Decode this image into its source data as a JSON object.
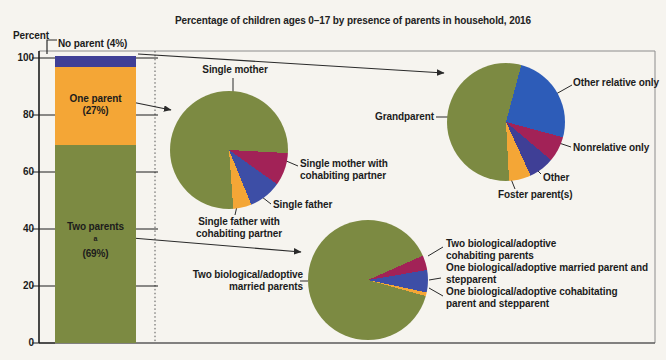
{
  "title": "Percentage of children ages 0–17 by presence of parents in household, 2016",
  "y_axis": {
    "label": "Percent"
  },
  "palette": {
    "green": "#7c8a42",
    "orange": "#f4a636",
    "indigo": "#3f3f96",
    "bright_blue": "#2d5cb8",
    "mid_blue": "#3d4ea6",
    "maroon": "#a22257",
    "text": "#1c1c1c"
  },
  "chart_data": [
    {
      "type": "bar",
      "stacked": true,
      "ylabel": "Percent",
      "ylim": [
        0,
        100
      ],
      "yticks": [
        0,
        20,
        40,
        60,
        80,
        100
      ],
      "segments": [
        {
          "label": "Two parents",
          "footnote_marker": "a",
          "pct_label": "(69%)",
          "value": 69,
          "color": "#7c8a42"
        },
        {
          "label": "One parent",
          "pct_label": "(27%)",
          "value": 27,
          "color": "#f4a636"
        },
        {
          "label": "No parent (4%)",
          "value": 4,
          "color": "#3f3f96"
        }
      ]
    },
    {
      "type": "pie",
      "title": "One parent breakdown",
      "start_angle_deg": 93,
      "slices": [
        {
          "label": "Single mother with cohabiting partner",
          "value": 9,
          "color": "#a22257"
        },
        {
          "label": "Single father",
          "value": 9,
          "color": "#3d4ea6"
        },
        {
          "label": "Single father with cohabiting partner",
          "value": 5,
          "color": "#f4a636"
        },
        {
          "label": "Single mother",
          "value": 77,
          "color": "#7c8a42"
        }
      ]
    },
    {
      "type": "pie",
      "title": "No parent breakdown",
      "start_angle_deg": 15,
      "slices": [
        {
          "label": "Other relative only",
          "value": 25,
          "color": "#2d5cb8"
        },
        {
          "label": "Nonrelative only",
          "value": 7,
          "color": "#a22257"
        },
        {
          "label": "Other",
          "value": 7,
          "color": "#3f3f96"
        },
        {
          "label": "Foster parent(s)",
          "value": 6,
          "color": "#f4a636"
        },
        {
          "label": "Grandparent",
          "value": 55,
          "color": "#7c8a42"
        }
      ]
    },
    {
      "type": "pie",
      "title": "Two parents breakdown",
      "start_angle_deg": 66,
      "slices": [
        {
          "label": "Two biological/adoptive cohabiting parents",
          "value": 4,
          "color": "#a22257"
        },
        {
          "label": "One biological/adoptive married parent and stepparent",
          "value": 6,
          "color": "#3d4ea6"
        },
        {
          "label": "One biological/adoptive cohabitating parent and stepparent",
          "value": 1,
          "color": "#f4a636"
        },
        {
          "label": "Two biological/adoptive married parents",
          "value": 89,
          "color": "#7c8a42"
        }
      ]
    }
  ]
}
